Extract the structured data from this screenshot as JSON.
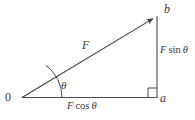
{
  "figure": {
    "kind": "force-vector-decomposition-diagram",
    "width": 195,
    "height": 120,
    "background_color": "#ffffff",
    "stroke_color": "#444444",
    "text_color": "#3a3a3a"
  },
  "labels": {
    "origin": "0",
    "point_b": "b",
    "point_a": "a",
    "force": "F",
    "angle": "θ",
    "vertical_component_var": "F",
    "vertical_component_fn": "sin",
    "vertical_component_angle": "θ",
    "horizontal_component_var": "F",
    "horizontal_component_fn": "cos",
    "horizontal_component_angle": "θ",
    "vertical_component_full": "F sin θ",
    "horizontal_component_full": "F cos θ"
  },
  "geometry": {
    "origin_point": [
      22,
      98
    ],
    "tip_point_b": [
      157,
      16
    ],
    "corner_point_a": [
      157,
      98
    ],
    "hypotenuse_has_arrowhead": true,
    "right_angle_marker_at": "a",
    "angle_arc_at": "origin",
    "angle_arc_radius": 40
  }
}
